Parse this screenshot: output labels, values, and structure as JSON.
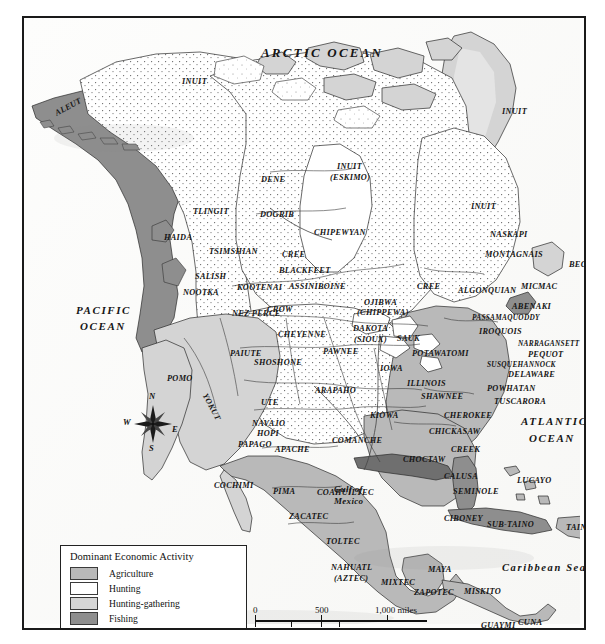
{
  "map": {
    "title": "Dominant Economic Activity of Native North America",
    "oceans": [
      {
        "name": "ARCTIC OCEAN",
        "x": 237,
        "y": 28,
        "cls": "ocean"
      },
      {
        "name": "PACIFIC",
        "x": 52,
        "y": 287,
        "cls": "ocean sm"
      },
      {
        "name": "OCEAN",
        "x": 56,
        "y": 303,
        "cls": "ocean sm"
      },
      {
        "name": "ATLANTIC",
        "x": 497,
        "y": 398,
        "cls": "ocean sm"
      },
      {
        "name": "OCEAN",
        "x": 505,
        "y": 415,
        "cls": "ocean sm"
      }
    ],
    "seas": [
      {
        "name": "Caribbean Sea",
        "x": 478,
        "y": 544,
        "cls": "sea"
      }
    ],
    "gulfs": [
      {
        "name": "Gulf of",
        "x": 310,
        "y": 467,
        "cls": "gulf"
      },
      {
        "name": "Mexico",
        "x": 310,
        "y": 479,
        "cls": "gulf"
      }
    ],
    "tribes": [
      {
        "name": "INUIT",
        "x": 158,
        "y": 60,
        "rot": 0
      },
      {
        "name": "INUIT",
        "x": 478,
        "y": 90,
        "rot": 0
      },
      {
        "name": "ALEUT",
        "x": 32,
        "y": 92,
        "rot": -28
      },
      {
        "name": "DENE",
        "x": 237,
        "y": 158,
        "rot": 0
      },
      {
        "name": "INUIT",
        "x": 313,
        "y": 145,
        "rot": 0
      },
      {
        "name": "(ESKIMO)",
        "x": 306,
        "y": 156,
        "rot": 0
      },
      {
        "name": "INUIT",
        "x": 447,
        "y": 185,
        "rot": 0
      },
      {
        "name": "TLINGIT",
        "x": 169,
        "y": 190,
        "rot": 0
      },
      {
        "name": "DOGRIB",
        "x": 236,
        "y": 193,
        "rot": 0
      },
      {
        "name": "CHIPEWYAN",
        "x": 290,
        "y": 211,
        "rot": 0
      },
      {
        "name": "NASKAPI",
        "x": 466,
        "y": 213,
        "rot": 0
      },
      {
        "name": "HAIDA",
        "x": 140,
        "y": 216,
        "rot": 0
      },
      {
        "name": "TSIMSHIAN",
        "x": 185,
        "y": 230,
        "rot": 0
      },
      {
        "name": "CREE",
        "x": 258,
        "y": 233,
        "rot": 0
      },
      {
        "name": "MONTAGNAIS",
        "x": 461,
        "y": 233,
        "rot": 0
      },
      {
        "name": "BLACKFEET",
        "x": 255,
        "y": 249,
        "rot": 0
      },
      {
        "name": "BEOTHUK",
        "x": 545,
        "y": 243,
        "rot": 0
      },
      {
        "name": "SALISH",
        "x": 171,
        "y": 255,
        "rot": 0
      },
      {
        "name": "KOOTENAI",
        "x": 213,
        "y": 266,
        "rot": 0
      },
      {
        "name": "ASSINIBOINE",
        "x": 265,
        "y": 265,
        "rot": 0
      },
      {
        "name": "CREE",
        "x": 393,
        "y": 265,
        "rot": 0
      },
      {
        "name": "ALGONQUIAN",
        "x": 434,
        "y": 269,
        "rot": 0
      },
      {
        "name": "MICMAC",
        "x": 497,
        "y": 265,
        "rot": 0
      },
      {
        "name": "NOOTKA",
        "x": 159,
        "y": 271,
        "rot": 0
      },
      {
        "name": "OJIBWA",
        "x": 340,
        "y": 281,
        "rot": 0
      },
      {
        "name": "ABENAKI",
        "x": 488,
        "y": 285,
        "rot": 0
      },
      {
        "name": "NEZ PERCE",
        "x": 208,
        "y": 292,
        "rot": 0
      },
      {
        "name": "CROW",
        "x": 243,
        "y": 288,
        "rot": 0
      },
      {
        "name": "(CHIPPEWA)",
        "x": 333,
        "y": 291,
        "rot": 0
      },
      {
        "name": "PASSAMAQUODDY",
        "x": 448,
        "y": 296,
        "rot": 0
      },
      {
        "name": "CHEYENNE",
        "x": 254,
        "y": 313,
        "rot": 0
      },
      {
        "name": "DAKOTA",
        "x": 329,
        "y": 307,
        "rot": 0
      },
      {
        "name": "IROQUOIS",
        "x": 455,
        "y": 310,
        "rot": 0
      },
      {
        "name": "(SIOUX)",
        "x": 330,
        "y": 318,
        "rot": 0
      },
      {
        "name": "SAUK",
        "x": 373,
        "y": 317,
        "rot": 0
      },
      {
        "name": "NARRAGANSETT",
        "x": 494,
        "y": 322,
        "rot": 0
      },
      {
        "name": "PAIUTE",
        "x": 206,
        "y": 332,
        "rot": 0
      },
      {
        "name": "PAWNEE",
        "x": 299,
        "y": 330,
        "rot": 0
      },
      {
        "name": "POTAWATOMI",
        "x": 388,
        "y": 332,
        "rot": 0
      },
      {
        "name": "PEQUOT",
        "x": 504,
        "y": 333,
        "rot": 0
      },
      {
        "name": "SHOSHONE",
        "x": 230,
        "y": 341,
        "rot": 0
      },
      {
        "name": "IOWA",
        "x": 356,
        "y": 347,
        "rot": 0
      },
      {
        "name": "SUSQUEHANNOCK",
        "x": 463,
        "y": 343,
        "rot": 0
      },
      {
        "name": "DELAWARE",
        "x": 484,
        "y": 353,
        "rot": 0
      },
      {
        "name": "POMO",
        "x": 143,
        "y": 357,
        "rot": 0
      },
      {
        "name": "ILLINOIS",
        "x": 383,
        "y": 362,
        "rot": 0
      },
      {
        "name": "ARAPAHO",
        "x": 291,
        "y": 369,
        "rot": 0
      },
      {
        "name": "POWHATAN",
        "x": 463,
        "y": 367,
        "rot": 0
      },
      {
        "name": "SHAWNEE",
        "x": 397,
        "y": 375,
        "rot": 0
      },
      {
        "name": "YOKUT",
        "x": 180,
        "y": 372,
        "rot": 62
      },
      {
        "name": "TUSCARORA",
        "x": 470,
        "y": 380,
        "rot": 0
      },
      {
        "name": "UTE",
        "x": 237,
        "y": 381,
        "rot": 0
      },
      {
        "name": "KIOWA",
        "x": 346,
        "y": 394,
        "rot": 0
      },
      {
        "name": "NAVAJO",
        "x": 228,
        "y": 402,
        "rot": 0
      },
      {
        "name": "CHEROKEE",
        "x": 420,
        "y": 394,
        "rot": 0
      },
      {
        "name": "HOPI",
        "x": 233,
        "y": 412,
        "rot": 0
      },
      {
        "name": "PAPAGO",
        "x": 214,
        "y": 423,
        "rot": 0
      },
      {
        "name": "COMANCHE",
        "x": 308,
        "y": 419,
        "rot": 0
      },
      {
        "name": "CHICKASAW",
        "x": 405,
        "y": 410,
        "rot": 0
      },
      {
        "name": "APACHE",
        "x": 251,
        "y": 428,
        "rot": 0
      },
      {
        "name": "CREEK",
        "x": 427,
        "y": 428,
        "rot": 0
      },
      {
        "name": "CHOCTAW",
        "x": 379,
        "y": 438,
        "rot": 0
      },
      {
        "name": "COCHIMI",
        "x": 190,
        "y": 464,
        "rot": 0
      },
      {
        "name": "CALUSA",
        "x": 420,
        "y": 455,
        "rot": 0
      },
      {
        "name": "LUCAYO",
        "x": 493,
        "y": 459,
        "rot": 0
      },
      {
        "name": "PIMA",
        "x": 249,
        "y": 470,
        "rot": 0
      },
      {
        "name": "COAHUILTEC",
        "x": 293,
        "y": 471,
        "rot": 0
      },
      {
        "name": "SEMINOLE",
        "x": 429,
        "y": 470,
        "rot": 0
      },
      {
        "name": "ZACATEC",
        "x": 265,
        "y": 495,
        "rot": 0
      },
      {
        "name": "CIBONEY",
        "x": 420,
        "y": 497,
        "rot": 0
      },
      {
        "name": "SUB-TAINO",
        "x": 463,
        "y": 503,
        "rot": 0
      },
      {
        "name": "TAINO",
        "x": 542,
        "y": 506,
        "rot": 0
      },
      {
        "name": "TOLTEC",
        "x": 302,
        "y": 520,
        "rot": 0
      },
      {
        "name": "NAHUATL",
        "x": 307,
        "y": 546,
        "rot": 0
      },
      {
        "name": "MAYA",
        "x": 404,
        "y": 548,
        "rot": 0
      },
      {
        "name": "(AZTEC)",
        "x": 310,
        "y": 557,
        "rot": 0
      },
      {
        "name": "MIXTEC",
        "x": 357,
        "y": 561,
        "rot": 0
      },
      {
        "name": "ZAPOTEC",
        "x": 390,
        "y": 571,
        "rot": 0
      },
      {
        "name": "MISKITO",
        "x": 440,
        "y": 570,
        "rot": 0
      },
      {
        "name": "GUAYMI",
        "x": 457,
        "y": 604,
        "rot": 0
      },
      {
        "name": "CUNA",
        "x": 494,
        "y": 601,
        "rot": 0
      }
    ]
  },
  "legend": {
    "title": "Dominant Economic Activity",
    "items": [
      {
        "label": "Agriculture",
        "swatch": "sw-agri",
        "color": "#b9b9b9"
      },
      {
        "label": "Hunting",
        "swatch": "sw-hunt",
        "color": "#ffffff"
      },
      {
        "label": "Hunting-gathering",
        "swatch": "sw-hg",
        "color": "#d6d6d6"
      },
      {
        "label": "Fishing",
        "swatch": "sw-fish",
        "color": "#8e8e8e"
      }
    ]
  },
  "scale": {
    "miles": {
      "ticks": [
        "0",
        "500",
        "1,000"
      ],
      "unit": "miles"
    },
    "kilometers": {
      "ticks": [
        "0",
        "500",
        "1,000"
      ],
      "unit": "kilometers"
    },
    "miles_label": "1,000 miles",
    "km_label": "1,000 kilometers"
  },
  "compass": {
    "north": "N",
    "south": "S",
    "east": "E",
    "west": "W"
  }
}
